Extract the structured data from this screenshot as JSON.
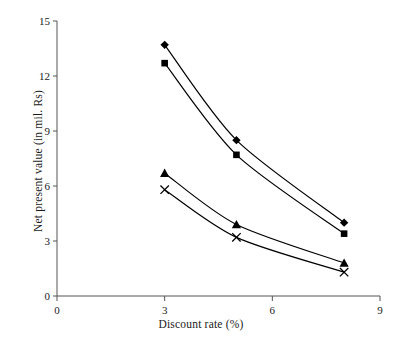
{
  "chart_data": {
    "type": "line",
    "title": "",
    "subtitle": "",
    "xlabel": "Discount rate (%)",
    "ylabel": "Net present value (in mil. Rs)",
    "x": [
      3,
      5,
      8
    ],
    "xlim": [
      0,
      9
    ],
    "ylim": [
      0,
      15
    ],
    "xticks": [
      "0",
      "3",
      "6",
      "9"
    ],
    "xtick_values": [
      0,
      3,
      6,
      9
    ],
    "yticks": [
      "0",
      "3",
      "6",
      "9",
      "12",
      "15"
    ],
    "ytick_values": [
      0,
      3,
      6,
      9,
      12,
      15
    ],
    "grid": false,
    "legend": "none",
    "series": [
      {
        "name": "series-1",
        "marker": "diamond",
        "color": "#000000",
        "values": [
          13.7,
          8.5,
          4.0
        ]
      },
      {
        "name": "series-2",
        "marker": "square",
        "color": "#000000",
        "values": [
          12.7,
          7.7,
          3.4
        ]
      },
      {
        "name": "series-3",
        "marker": "triangle",
        "color": "#000000",
        "values": [
          6.7,
          3.9,
          1.8
        ]
      },
      {
        "name": "series-4",
        "marker": "cross",
        "color": "#000000",
        "values": [
          5.8,
          3.2,
          1.3
        ]
      }
    ]
  },
  "axis": {
    "x_title": "Discount rate (%)",
    "y_title": "Net present value (in mil. Rs)",
    "x_tick_labels": [
      "0",
      "3",
      "6",
      "9"
    ],
    "y_tick_labels": [
      "0",
      "3",
      "6",
      "9",
      "12",
      "15"
    ]
  },
  "colors": {
    "background": "#ffffff",
    "axis": "#555555",
    "line": "#000000",
    "text": "#1a1a1a"
  }
}
